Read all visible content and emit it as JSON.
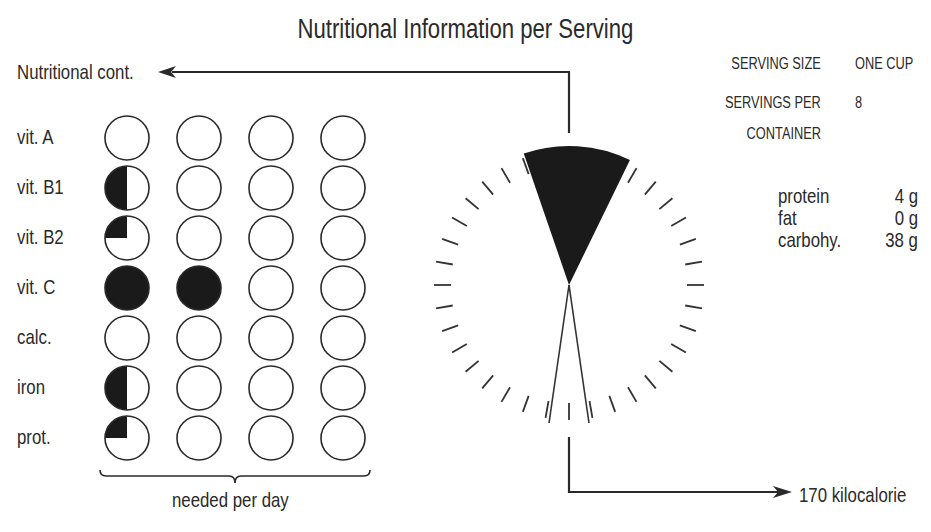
{
  "title": "Nutritional Information per Serving",
  "left_arrow_label": "Nutritional cont.",
  "bottom_arrow_label": "170 kilocalorie",
  "grid_caption": "needed per day",
  "serving": {
    "size_label": "SERVING SIZE",
    "size_value": "ONE CUP",
    "per_container_label_1": "SERVINGS PER",
    "per_container_label_2": "CONTAINER",
    "per_container_value": "8"
  },
  "macros": [
    {
      "name": "protein",
      "value": "4 g"
    },
    {
      "name": "fat",
      "value": "0 g"
    },
    {
      "name": "carbohy.",
      "value": "38 g"
    }
  ],
  "nutrients": [
    {
      "label": "vit. A",
      "fill": [
        0,
        0,
        0,
        0
      ]
    },
    {
      "label": "vit. B1",
      "fill": [
        0.5,
        0,
        0,
        0
      ]
    },
    {
      "label": "vit. B2",
      "fill": [
        0.25,
        0,
        0,
        0
      ]
    },
    {
      "label": "vit. C",
      "fill": [
        1,
        1,
        0,
        0
      ]
    },
    {
      "label": "calc.",
      "fill": [
        0,
        0,
        0,
        0
      ]
    },
    {
      "label": "iron",
      "fill": [
        0.5,
        0,
        0,
        0
      ]
    },
    {
      "label": "prot.",
      "fill": [
        0.25,
        0,
        0,
        0
      ]
    }
  ],
  "colors": {
    "ink": "#1a1a1a",
    "paper": "#ffffff"
  },
  "chart_data": {
    "type": "pictogram",
    "title": "Nutritional Information per Serving",
    "categories": [
      "vit. A",
      "vit. B1",
      "vit. B2",
      "vit. C",
      "calc.",
      "iron",
      "prot."
    ],
    "values_fraction_of_daily_need": [
      0,
      0.125,
      0.0625,
      0.5,
      0,
      0.125,
      0.0625
    ],
    "circles_per_row": 4,
    "circle_fill": [
      [
        0,
        0,
        0,
        0
      ],
      [
        0.5,
        0,
        0,
        0
      ],
      [
        0.25,
        0,
        0,
        0
      ],
      [
        1,
        1,
        0,
        0
      ],
      [
        0,
        0,
        0,
        0
      ],
      [
        0.5,
        0,
        0,
        0
      ],
      [
        0.25,
        0,
        0,
        0
      ]
    ],
    "xlabel": "needed per day",
    "dial": {
      "ticks": 36,
      "filled_wedge_deg": [
        -19,
        26
      ],
      "calories": 170,
      "label": "170 kilocalorie"
    },
    "serving_size": "ONE CUP",
    "servings_per_container": 8,
    "macros_g": {
      "protein": 4,
      "fat": 0,
      "carbohydrate": 38
    }
  }
}
